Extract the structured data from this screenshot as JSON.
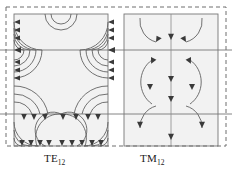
{
  "figure": {
    "name": "waveguide-mode-field-patterns",
    "background_color": "#ffffff",
    "width": 232,
    "height": 180,
    "panel_fill": "#f2f2f2",
    "line_color": "#555555",
    "border_color": "#7a7a7a",
    "dashed_border_color": "#6e6e6e",
    "label_color": "#1a1a1a"
  },
  "panels": [
    {
      "id": "te12",
      "label_main": "TE",
      "label_sub": "12",
      "label_full": "TE12",
      "field_style": "nested-arc-loops",
      "arrow_count": 34
    },
    {
      "id": "tm12",
      "label_main": "TM",
      "label_sub": "12",
      "label_full": "TM12",
      "field_style": "arcs-and-vertical-arrows",
      "arrow_count": 16
    }
  ],
  "dividers": {
    "horizontal_y": [
      50,
      114
    ],
    "count": 2
  }
}
